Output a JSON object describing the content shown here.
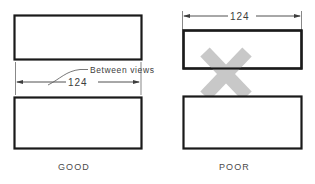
{
  "figure": {
    "background_color": "#ffffff",
    "outline_color": "#1a1a1a",
    "dimension_color": "#3d3d3d",
    "caption_color": "#4a4a4a",
    "reject_mark_color": "#c8c8c8"
  },
  "panels": [
    {
      "id": "good",
      "caption": "GOOD",
      "dimension_value": "124",
      "dimension_placement": "between views",
      "annotation": {
        "label": "Between views",
        "leader": "curved leader from dimension line to label"
      },
      "views": [
        {
          "name": "top-view",
          "shape": "rectangle"
        },
        {
          "name": "front-view",
          "shape": "rectangle"
        }
      ],
      "reject_mark": false
    },
    {
      "id": "poor",
      "caption": "POOR",
      "dimension_value": "124",
      "dimension_placement": "above top view",
      "annotation": null,
      "views": [
        {
          "name": "top-view",
          "shape": "rectangle"
        },
        {
          "name": "front-view",
          "shape": "rectangle"
        }
      ],
      "reject_mark": true,
      "reject_mark_symbol": "X"
    }
  ]
}
